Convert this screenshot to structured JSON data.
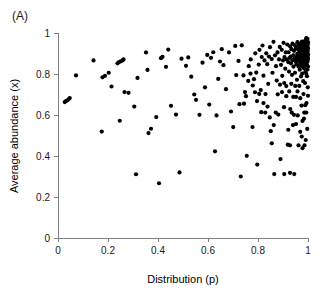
{
  "figure": {
    "panel_label": "(A)",
    "background_color": "#ffffff",
    "point_color": "#000000",
    "axis_color": "#808080"
  },
  "chart_data": {
    "type": "scatter",
    "title": "",
    "xlabel": "Distribution (p)",
    "ylabel": "Average abundance (x)",
    "xlim": [
      0,
      1
    ],
    "ylim": [
      0,
      1
    ],
    "xticks": [
      0,
      0.2,
      0.4,
      0.6,
      0.8,
      1
    ],
    "xtick_labels": [
      "0",
      "0.2",
      "0.4",
      "0.6",
      "0.8",
      "1"
    ],
    "yticks": [
      0,
      0.2,
      0.4,
      0.6,
      0.8,
      1
    ],
    "ytick_labels": [
      "0",
      "0.2",
      "0.4",
      "0.6",
      "0.8",
      "1"
    ],
    "grid": false,
    "legend": null,
    "marker": "circle",
    "marker_size": 2.1,
    "points": [
      [
        0.027,
        0.663
      ],
      [
        0.032,
        0.668
      ],
      [
        0.038,
        0.672
      ],
      [
        0.043,
        0.678
      ],
      [
        0.047,
        0.683
      ],
      [
        0.072,
        0.793
      ],
      [
        0.142,
        0.866
      ],
      [
        0.175,
        0.519
      ],
      [
        0.178,
        0.784
      ],
      [
        0.188,
        0.791
      ],
      [
        0.203,
        0.806
      ],
      [
        0.214,
        0.739
      ],
      [
        0.238,
        0.852
      ],
      [
        0.244,
        0.858
      ],
      [
        0.251,
        0.862
      ],
      [
        0.258,
        0.866
      ],
      [
        0.262,
        0.871
      ],
      [
        0.247,
        0.572
      ],
      [
        0.266,
        0.712
      ],
      [
        0.282,
        0.708
      ],
      [
        0.305,
        0.641
      ],
      [
        0.312,
        0.311
      ],
      [
        0.318,
        0.781
      ],
      [
        0.352,
        0.905
      ],
      [
        0.358,
        0.82
      ],
      [
        0.362,
        0.512
      ],
      [
        0.372,
        0.533
      ],
      [
        0.393,
        0.59
      ],
      [
        0.404,
        0.267
      ],
      [
        0.412,
        0.877
      ],
      [
        0.418,
        0.884
      ],
      [
        0.432,
        0.835
      ],
      [
        0.441,
        0.919
      ],
      [
        0.452,
        0.645
      ],
      [
        0.472,
        0.602
      ],
      [
        0.486,
        0.32
      ],
      [
        0.494,
        0.875
      ],
      [
        0.512,
        0.84
      ],
      [
        0.521,
        0.881
      ],
      [
        0.533,
        0.787
      ],
      [
        0.545,
        0.7
      ],
      [
        0.552,
        0.674
      ],
      [
        0.566,
        0.601
      ],
      [
        0.578,
        0.855
      ],
      [
        0.588,
        0.735
      ],
      [
        0.597,
        0.893
      ],
      [
        0.605,
        0.651
      ],
      [
        0.612,
        0.879
      ],
      [
        0.621,
        0.906
      ],
      [
        0.628,
        0.423
      ],
      [
        0.634,
        0.598
      ],
      [
        0.641,
        0.776
      ],
      [
        0.648,
        0.861
      ],
      [
        0.655,
        0.921
      ],
      [
        0.662,
        0.843
      ],
      [
        0.672,
        0.726
      ],
      [
        0.684,
        0.905
      ],
      [
        0.692,
        0.617
      ],
      [
        0.701,
        0.541
      ],
      [
        0.709,
        0.937
      ],
      [
        0.713,
        0.795
      ],
      [
        0.722,
        0.864
      ],
      [
        0.726,
        0.653
      ],
      [
        0.731,
        0.3
      ],
      [
        0.735,
        0.94
      ],
      [
        0.742,
        0.793
      ],
      [
        0.748,
        0.712
      ],
      [
        0.755,
        0.401
      ],
      [
        0.763,
        0.838
      ],
      [
        0.771,
        0.871
      ],
      [
        0.778,
        0.541
      ],
      [
        0.784,
        0.775
      ],
      [
        0.789,
        0.901
      ],
      [
        0.793,
        0.807
      ],
      [
        0.797,
        0.358
      ],
      [
        0.803,
        0.846
      ],
      [
        0.806,
        0.918
      ],
      [
        0.811,
        0.722
      ],
      [
        0.815,
        0.883
      ],
      [
        0.818,
        0.939
      ],
      [
        0.822,
        0.792
      ],
      [
        0.826,
        0.866
      ],
      [
        0.829,
        0.612
      ],
      [
        0.833,
        0.901
      ],
      [
        0.837,
        0.848
      ],
      [
        0.841,
        0.752
      ],
      [
        0.844,
        0.885
      ],
      [
        0.848,
        0.931
      ],
      [
        0.851,
        0.521
      ],
      [
        0.855,
        0.873
      ],
      [
        0.858,
        0.806
      ],
      [
        0.862,
        0.957
      ],
      [
        0.865,
        0.312
      ],
      [
        0.868,
        0.891
      ],
      [
        0.872,
        0.838
      ],
      [
        0.875,
        0.768
      ],
      [
        0.878,
        0.905
      ],
      [
        0.881,
        0.602
      ],
      [
        0.884,
        0.871
      ],
      [
        0.887,
        0.932
      ],
      [
        0.89,
        0.385
      ],
      [
        0.892,
        0.845
      ],
      [
        0.895,
        0.918
      ],
      [
        0.897,
        0.791
      ],
      [
        0.9,
        0.866
      ],
      [
        0.902,
        0.952
      ],
      [
        0.904,
        0.638
      ],
      [
        0.906,
        0.883
      ],
      [
        0.909,
        0.826
      ],
      [
        0.911,
        0.905
      ],
      [
        0.913,
        0.741
      ],
      [
        0.915,
        0.871
      ],
      [
        0.917,
        0.944
      ],
      [
        0.919,
        0.455
      ],
      [
        0.921,
        0.858
      ],
      [
        0.922,
        0.906
      ],
      [
        0.924,
        0.812
      ],
      [
        0.926,
        0.878
      ],
      [
        0.928,
        0.935
      ],
      [
        0.929,
        0.629
      ],
      [
        0.931,
        0.885
      ],
      [
        0.932,
        0.852
      ],
      [
        0.934,
        0.921
      ],
      [
        0.936,
        0.796
      ],
      [
        0.937,
        0.868
      ],
      [
        0.938,
        0.948
      ],
      [
        0.94,
        0.551
      ],
      [
        0.941,
        0.891
      ],
      [
        0.942,
        0.836
      ],
      [
        0.944,
        0.913
      ],
      [
        0.945,
        0.312
      ],
      [
        0.946,
        0.875
      ],
      [
        0.947,
        0.941
      ],
      [
        0.948,
        0.806
      ],
      [
        0.95,
        0.862
      ],
      [
        0.951,
        0.925
      ],
      [
        0.952,
        0.688
      ],
      [
        0.953,
        0.883
      ],
      [
        0.954,
        0.848
      ],
      [
        0.955,
        0.931
      ],
      [
        0.956,
        0.772
      ],
      [
        0.957,
        0.898
      ],
      [
        0.958,
        0.955
      ],
      [
        0.959,
        0.598
      ],
      [
        0.96,
        0.871
      ],
      [
        0.961,
        0.918
      ],
      [
        0.962,
        0.836
      ],
      [
        0.963,
        0.888
      ],
      [
        0.964,
        0.945
      ],
      [
        0.965,
        0.742
      ],
      [
        0.965,
        0.862
      ],
      [
        0.966,
        0.905
      ],
      [
        0.967,
        0.821
      ],
      [
        0.968,
        0.876
      ],
      [
        0.968,
        0.938
      ],
      [
        0.969,
        0.518
      ],
      [
        0.97,
        0.893
      ],
      [
        0.97,
        0.851
      ],
      [
        0.971,
        0.926
      ],
      [
        0.972,
        0.788
      ],
      [
        0.972,
        0.866
      ],
      [
        0.973,
        0.951
      ],
      [
        0.974,
        0.646
      ],
      [
        0.974,
        0.884
      ],
      [
        0.975,
        0.838
      ],
      [
        0.975,
        0.915
      ],
      [
        0.976,
        0.958
      ],
      [
        0.977,
        0.802
      ],
      [
        0.977,
        0.871
      ],
      [
        0.978,
        0.934
      ],
      [
        0.978,
        0.571
      ],
      [
        0.979,
        0.897
      ],
      [
        0.98,
        0.855
      ],
      [
        0.98,
        0.922
      ],
      [
        0.981,
        0.765
      ],
      [
        0.981,
        0.88
      ],
      [
        0.982,
        0.946
      ],
      [
        0.982,
        0.702
      ],
      [
        0.983,
        0.862
      ],
      [
        0.983,
        0.908
      ],
      [
        0.984,
        0.828
      ],
      [
        0.984,
        0.89
      ],
      [
        0.985,
        0.953
      ],
      [
        0.985,
        0.612
      ],
      [
        0.986,
        0.874
      ],
      [
        0.986,
        0.931
      ],
      [
        0.987,
        0.843
      ],
      [
        0.987,
        0.899
      ],
      [
        0.988,
        0.962
      ],
      [
        0.988,
        0.756
      ],
      [
        0.989,
        0.885
      ],
      [
        0.989,
        0.918
      ],
      [
        0.99,
        0.812
      ],
      [
        0.99,
        0.868
      ],
      [
        0.991,
        0.941
      ],
      [
        0.991,
        0.478
      ],
      [
        0.991,
        0.893
      ],
      [
        0.992,
        0.856
      ],
      [
        0.992,
        0.927
      ],
      [
        0.993,
        0.975
      ],
      [
        0.993,
        0.801
      ],
      [
        0.993,
        0.877
      ],
      [
        0.994,
        0.936
      ],
      [
        0.994,
        0.658
      ],
      [
        0.994,
        0.905
      ],
      [
        0.995,
        0.848
      ],
      [
        0.995,
        0.958
      ],
      [
        0.995,
        0.884
      ],
      [
        0.996,
        0.921
      ],
      [
        0.996,
        0.789
      ],
      [
        0.996,
        0.866
      ],
      [
        0.997,
        0.948
      ],
      [
        0.997,
        0.532
      ],
      [
        0.997,
        0.901
      ],
      [
        0.998,
        0.861
      ],
      [
        0.998,
        0.93
      ],
      [
        0.998,
        0.972
      ],
      [
        0.998,
        0.822
      ],
      [
        0.999,
        0.89
      ],
      [
        0.999,
        0.943
      ],
      [
        0.999,
        0.735
      ],
      [
        0.999,
        0.872
      ],
      [
        0.999,
        0.912
      ],
      [
        1.0,
        0.836
      ],
      [
        1.0,
        0.896
      ],
      [
        1.0,
        0.955
      ],
      [
        1.0,
        0.694
      ],
      [
        1.0,
        0.878
      ],
      [
        1.0,
        0.925
      ],
      [
        0.986,
        0.452
      ],
      [
        0.978,
        0.438
      ],
      [
        0.962,
        0.452
      ],
      [
        0.952,
        0.556
      ],
      [
        0.944,
        0.601
      ],
      [
        0.935,
        0.612
      ],
      [
        0.928,
        0.452
      ],
      [
        0.921,
        0.528
      ],
      [
        0.993,
        0.612
      ],
      [
        0.989,
        0.648
      ],
      [
        0.984,
        0.582
      ],
      [
        0.975,
        0.495
      ],
      [
        0.969,
        0.682
      ],
      [
        0.958,
        0.715
      ],
      [
        0.949,
        0.742
      ],
      [
        0.941,
        0.688
      ],
      [
        0.933,
        0.752
      ],
      [
        0.925,
        0.715
      ],
      [
        0.913,
        0.692
      ],
      [
        0.905,
        0.756
      ],
      [
        0.896,
        0.712
      ],
      [
        0.888,
        0.748
      ],
      [
        0.879,
        0.701
      ],
      [
        0.871,
        0.612
      ],
      [
        0.863,
        0.551
      ],
      [
        0.855,
        0.462
      ],
      [
        0.847,
        0.588
      ],
      [
        0.838,
        0.641
      ],
      [
        0.83,
        0.702
      ],
      [
        0.822,
        0.658
      ],
      [
        0.813,
        0.614
      ],
      [
        0.805,
        0.703
      ],
      [
        0.796,
        0.668
      ],
      [
        0.788,
        0.711
      ],
      [
        0.779,
        0.744
      ],
      [
        0.77,
        0.802
      ],
      [
        0.761,
        0.766
      ],
      [
        0.752,
        0.692
      ],
      [
        0.744,
        0.655
      ],
      [
        0.905,
        0.312
      ],
      [
        0.928,
        0.318
      ]
    ]
  }
}
